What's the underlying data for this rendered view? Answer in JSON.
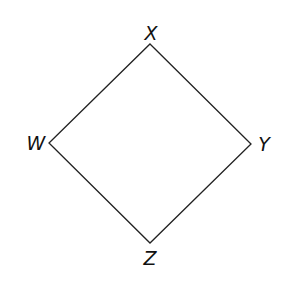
{
  "diagram": {
    "type": "quadrilateral",
    "shape": "rhombus/square rotated 45°",
    "colors": {
      "background": "#ffffff",
      "stroke": "#222222",
      "label": "#111111"
    },
    "vertices": [
      {
        "id": "X",
        "label": "X",
        "x": 150,
        "y": 44,
        "label_x": 151,
        "label_y": 40
      },
      {
        "id": "Y",
        "label": "Y",
        "x": 251,
        "y": 144,
        "label_x": 264,
        "label_y": 151
      },
      {
        "id": "Z",
        "label": "Z",
        "x": 150,
        "y": 243,
        "label_x": 150,
        "label_y": 265
      },
      {
        "id": "W",
        "label": "W",
        "x": 49,
        "y": 143,
        "label_x": 36,
        "label_y": 150
      }
    ],
    "edges": [
      {
        "from": "X",
        "to": "Y"
      },
      {
        "from": "Y",
        "to": "Z"
      },
      {
        "from": "Z",
        "to": "W"
      },
      {
        "from": "W",
        "to": "X"
      }
    ]
  }
}
